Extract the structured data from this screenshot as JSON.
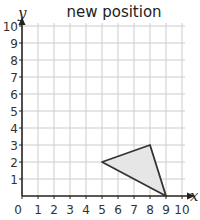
{
  "chart_data": {
    "type": "scatter",
    "title": "new position",
    "xlabel": "x",
    "ylabel": "y",
    "xlim": [
      0,
      10
    ],
    "ylim": [
      0,
      10
    ],
    "grid": true,
    "x_ticks": [
      0,
      1,
      2,
      3,
      4,
      5,
      6,
      7,
      8,
      9,
      10
    ],
    "y_ticks": [
      1,
      2,
      3,
      4,
      5,
      6,
      7,
      8,
      9,
      10
    ],
    "shapes": [
      {
        "name": "triangle",
        "vertices": [
          [
            5,
            2
          ],
          [
            8,
            3
          ],
          [
            9,
            0
          ]
        ],
        "fill": "#e6e6e6",
        "stroke": "#333333"
      }
    ]
  },
  "colors": {
    "grid": "#cccccc",
    "axis": "#222222",
    "shape_fill": "#e6e6e6",
    "shape_stroke": "#333333"
  }
}
